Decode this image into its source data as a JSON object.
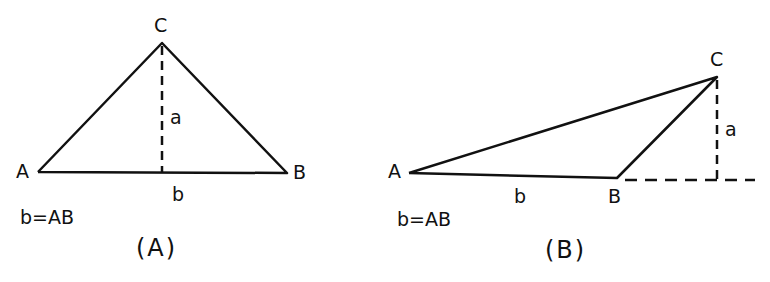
{
  "figures": [
    {
      "id": "A",
      "caption": "(A)",
      "formula": "b=AB",
      "vertices": {
        "A": "A",
        "B": "B",
        "C": "C"
      },
      "height_label": "a",
      "base_label": "b"
    },
    {
      "id": "B",
      "caption": "(B)",
      "formula": "b=AB",
      "vertices": {
        "A": "A",
        "B": "B",
        "C": "C"
      },
      "height_label": "a",
      "base_label": "b"
    }
  ],
  "colors": {
    "stroke": "#111111",
    "background": "#ffffff"
  }
}
